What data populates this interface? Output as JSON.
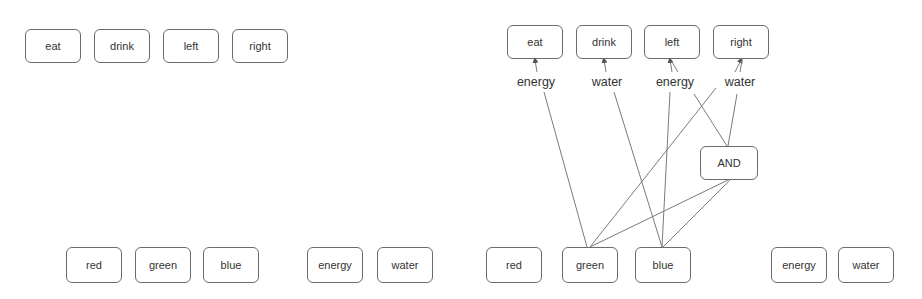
{
  "left_panel": {
    "actions": [
      {
        "label": "eat",
        "x": 25,
        "y": 29,
        "w": 56,
        "h": 34
      },
      {
        "label": "drink",
        "x": 94,
        "y": 29,
        "w": 56,
        "h": 34
      },
      {
        "label": "left",
        "x": 163,
        "y": 29,
        "w": 56,
        "h": 34
      },
      {
        "label": "right",
        "x": 232,
        "y": 29,
        "w": 56,
        "h": 34
      }
    ],
    "inputs": [
      {
        "label": "red",
        "x": 66,
        "y": 247,
        "w": 56,
        "h": 36
      },
      {
        "label": "green",
        "x": 135,
        "y": 247,
        "w": 56,
        "h": 36
      },
      {
        "label": "blue",
        "x": 203,
        "y": 247,
        "w": 56,
        "h": 36
      },
      {
        "label": "energy",
        "x": 307,
        "y": 247,
        "w": 56,
        "h": 36
      },
      {
        "label": "water",
        "x": 377,
        "y": 247,
        "w": 56,
        "h": 36
      }
    ]
  },
  "right_panel": {
    "actions": [
      {
        "label": "eat",
        "x": 507,
        "y": 25,
        "w": 56,
        "h": 34
      },
      {
        "label": "drink",
        "x": 576,
        "y": 25,
        "w": 56,
        "h": 34
      },
      {
        "label": "left",
        "x": 644,
        "y": 25,
        "w": 56,
        "h": 34
      },
      {
        "label": "right",
        "x": 713,
        "y": 25,
        "w": 56,
        "h": 34
      }
    ],
    "edge_labels": [
      {
        "label": "energy",
        "x": 536,
        "y": 75
      },
      {
        "label": "water",
        "x": 607,
        "y": 75
      },
      {
        "label": "energy",
        "x": 675,
        "y": 75
      },
      {
        "label": "water",
        "x": 740,
        "y": 75
      }
    ],
    "gate": {
      "label": "AND",
      "x": 700,
      "y": 146,
      "w": 58,
      "h": 34
    },
    "inputs": [
      {
        "label": "red",
        "x": 486,
        "y": 247,
        "w": 56,
        "h": 36
      },
      {
        "label": "green",
        "x": 562,
        "y": 247,
        "w": 56,
        "h": 36
      },
      {
        "label": "blue",
        "x": 635,
        "y": 247,
        "w": 56,
        "h": 36
      },
      {
        "label": "energy",
        "x": 771,
        "y": 247,
        "w": 56,
        "h": 36
      },
      {
        "label": "water",
        "x": 838,
        "y": 247,
        "w": 56,
        "h": 36
      }
    ],
    "edges": [
      {
        "from": "green",
        "to": "energy-label-eat",
        "x1": 587,
        "y1": 247,
        "x2": 544,
        "y2": 92
      },
      {
        "from": "blue",
        "to": "water-label-drink",
        "x1": 662,
        "y1": 247,
        "x2": 614,
        "y2": 92
      },
      {
        "from": "blue",
        "to": "energy-label-left",
        "x1": 662,
        "y1": 247,
        "x2": 670,
        "y2": 92
      },
      {
        "from": "green",
        "to": "water-label-right",
        "x1": 590,
        "y1": 247,
        "x2": 716,
        "y2": 88
      },
      {
        "from": "green",
        "to": "and-gate",
        "x1": 590,
        "y1": 247,
        "x2": 728,
        "y2": 180
      },
      {
        "from": "blue",
        "to": "and-gate",
        "x1": 663,
        "y1": 247,
        "x2": 730,
        "y2": 180
      },
      {
        "from": "and-gate",
        "to": "energy-label-left",
        "x1": 727,
        "y1": 146,
        "x2": 694,
        "y2": 94
      },
      {
        "from": "and-gate",
        "to": "water-label-right",
        "x1": 728,
        "y1": 146,
        "x2": 737,
        "y2": 94
      },
      {
        "from": "energy-label-eat",
        "to": "eat",
        "x1": 537,
        "y1": 72,
        "x2": 535,
        "y2": 60,
        "arrow": true
      },
      {
        "from": "water-label-drink",
        "to": "drink",
        "x1": 606,
        "y1": 72,
        "x2": 604,
        "y2": 60,
        "arrow": true
      },
      {
        "from": "energy-label-left",
        "to": "left",
        "x1": 672,
        "y1": 72,
        "x2": 670,
        "y2": 60,
        "arrow": true
      },
      {
        "from": "energy-label-left-2",
        "to": "left",
        "x1": 678,
        "y1": 72,
        "x2": 672,
        "y2": 62,
        "arrow": false
      },
      {
        "from": "water-label-right",
        "to": "right",
        "x1": 735,
        "y1": 72,
        "x2": 741,
        "y2": 60,
        "arrow": true
      },
      {
        "from": "water-label-right-2",
        "to": "right",
        "x1": 740,
        "y1": 72,
        "x2": 742,
        "y2": 60,
        "arrow": false
      }
    ]
  },
  "colors": {
    "border": "#6b6b6b",
    "edge": "#7a7a7a",
    "text": "#333333"
  }
}
